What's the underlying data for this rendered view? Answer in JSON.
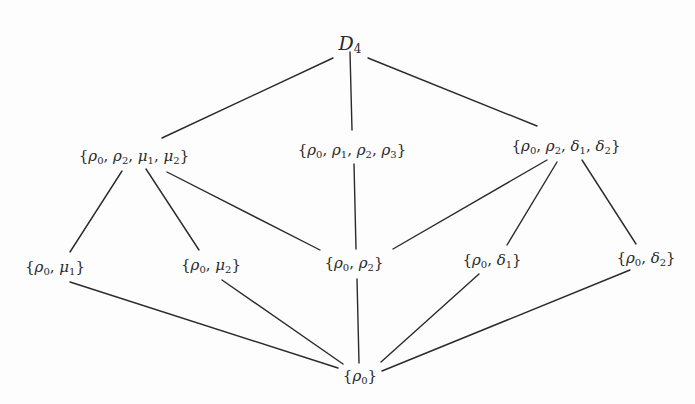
{
  "diagram": {
    "nodes": [
      {
        "id": "D4",
        "label": "D₄",
        "x": 350,
        "y": 44
      },
      {
        "id": "rho02mu12",
        "label": "{ρ₀, ρ₂, μ₁, μ₂}",
        "x": 134,
        "y": 157
      },
      {
        "id": "rho0123",
        "label": "{ρ₀, ρ₁, ρ₂, ρ₃}",
        "x": 352,
        "y": 151
      },
      {
        "id": "rho02delta12",
        "label": "{ρ₀, ρ₂, δ₁, δ₂}",
        "x": 566,
        "y": 147
      },
      {
        "id": "rho0mu1",
        "label": "{ρ₀, μ₁}",
        "x": 55,
        "y": 268
      },
      {
        "id": "rho0mu2",
        "label": "{ρ₀, μ₂}",
        "x": 211,
        "y": 266
      },
      {
        "id": "rho02",
        "label": "{ρ₀, ρ₂}",
        "x": 354,
        "y": 264
      },
      {
        "id": "rho0delta1",
        "label": "{ρ₀, δ₁}",
        "x": 492,
        "y": 261
      },
      {
        "id": "rho0delta2",
        "label": "{ρ₀, δ₂}",
        "x": 646,
        "y": 259
      },
      {
        "id": "rho0",
        "label": "{ρ₀}",
        "x": 360,
        "y": 377
      }
    ],
    "edges": [
      {
        "from": "D4",
        "to": "rho02mu12",
        "x1": 333,
        "y1": 58,
        "x2": 162,
        "y2": 138
      },
      {
        "from": "D4",
        "to": "rho0123",
        "x1": 350,
        "y1": 52,
        "x2": 352,
        "y2": 130
      },
      {
        "from": "D4",
        "to": "rho02delta12",
        "x1": 368,
        "y1": 58,
        "x2": 537,
        "y2": 126
      },
      {
        "from": "rho02mu12",
        "to": "rho0mu1",
        "x1": 122,
        "y1": 171,
        "x2": 70,
        "y2": 252
      },
      {
        "from": "rho02mu12",
        "to": "rho0mu2",
        "x1": 146,
        "y1": 169,
        "x2": 199,
        "y2": 250
      },
      {
        "from": "rho02mu12",
        "to": "rho02",
        "x1": 167,
        "y1": 172,
        "x2": 320,
        "y2": 250
      },
      {
        "from": "rho0123",
        "to": "rho02",
        "x1": 354,
        "y1": 164,
        "x2": 356,
        "y2": 249
      },
      {
        "from": "rho02delta12",
        "to": "rho02",
        "x1": 547,
        "y1": 160,
        "x2": 393,
        "y2": 249
      },
      {
        "from": "rho02delta12",
        "to": "rho0delta1",
        "x1": 557,
        "y1": 162,
        "x2": 507,
        "y2": 245
      },
      {
        "from": "rho02delta12",
        "to": "rho0delta2",
        "x1": 582,
        "y1": 160,
        "x2": 636,
        "y2": 244
      },
      {
        "from": "rho0mu1",
        "to": "rho0",
        "x1": 70,
        "y1": 282,
        "x2": 338,
        "y2": 368
      },
      {
        "from": "rho0mu2",
        "to": "rho0",
        "x1": 222,
        "y1": 280,
        "x2": 343,
        "y2": 364
      },
      {
        "from": "rho02",
        "to": "rho0",
        "x1": 357,
        "y1": 279,
        "x2": 359,
        "y2": 363
      },
      {
        "from": "rho0delta1",
        "to": "rho0",
        "x1": 479,
        "y1": 274,
        "x2": 381,
        "y2": 362
      },
      {
        "from": "rho0delta2",
        "to": "rho0",
        "x1": 630,
        "y1": 270,
        "x2": 382,
        "y2": 371
      }
    ]
  },
  "labels": {
    "top": {
      "base": "D",
      "sub": "4"
    },
    "row2": [
      {
        "parts": [
          [
            "ρ",
            "0"
          ],
          [
            "ρ",
            "2"
          ],
          [
            "μ",
            "1"
          ],
          [
            "μ",
            "2"
          ]
        ]
      },
      {
        "parts": [
          [
            "ρ",
            "0"
          ],
          [
            "ρ",
            "1"
          ],
          [
            "ρ",
            "2"
          ],
          [
            "ρ",
            "3"
          ]
        ]
      },
      {
        "parts": [
          [
            "ρ",
            "0"
          ],
          [
            "ρ",
            "2"
          ],
          [
            "δ",
            "1"
          ],
          [
            "δ",
            "2"
          ]
        ]
      }
    ],
    "row3": [
      {
        "parts": [
          [
            "ρ",
            "0"
          ],
          [
            "μ",
            "1"
          ]
        ]
      },
      {
        "parts": [
          [
            "ρ",
            "0"
          ],
          [
            "μ",
            "2"
          ]
        ]
      },
      {
        "parts": [
          [
            "ρ",
            "0"
          ],
          [
            "ρ",
            "2"
          ]
        ]
      },
      {
        "parts": [
          [
            "ρ",
            "0"
          ],
          [
            "δ",
            "1"
          ]
        ]
      },
      {
        "parts": [
          [
            "ρ",
            "0"
          ],
          [
            "δ",
            "2"
          ]
        ]
      }
    ],
    "bottom": {
      "parts": [
        [
          "ρ",
          "0"
        ]
      ]
    }
  },
  "colors": {
    "ink": "#2a2a2a",
    "background": "#fdfdfd"
  }
}
